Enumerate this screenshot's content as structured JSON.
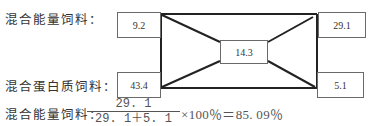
{
  "diagram": {
    "type": "pearson-square",
    "labels": {
      "energy_feed": "混合能量饲料：",
      "protein_feed": "混合蛋白质饲料："
    },
    "boxes": {
      "top_left": "9.2",
      "bottom_left": "43.4",
      "center": "14.3",
      "top_right": "29.1",
      "bottom_right": "5.1"
    },
    "line_color": "#222222",
    "box_border_color": "#6a6a6a"
  },
  "formula": {
    "label": "混合能量饲料：",
    "numerator": "29. 1",
    "denominator": "29. 1＋5. 1",
    "tail": "×100％＝85. 09％"
  }
}
